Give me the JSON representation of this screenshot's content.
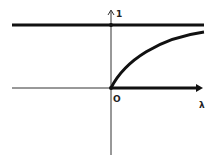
{
  "diagram": {
    "labels": {
      "y_tick": "1",
      "origin": "O",
      "x_axis": "λ"
    },
    "elements": [
      {
        "name": "asymptote-line",
        "value": 1,
        "style": "thick"
      },
      {
        "name": "curve",
        "description": "increasing concave curve from origin approaching 1"
      },
      {
        "name": "x-axis",
        "style": "thin for negative, thick for positive"
      },
      {
        "name": "y-axis",
        "style": "thin with arrow"
      }
    ],
    "colors": {
      "line": "#111111",
      "background": "#ffffff"
    }
  }
}
